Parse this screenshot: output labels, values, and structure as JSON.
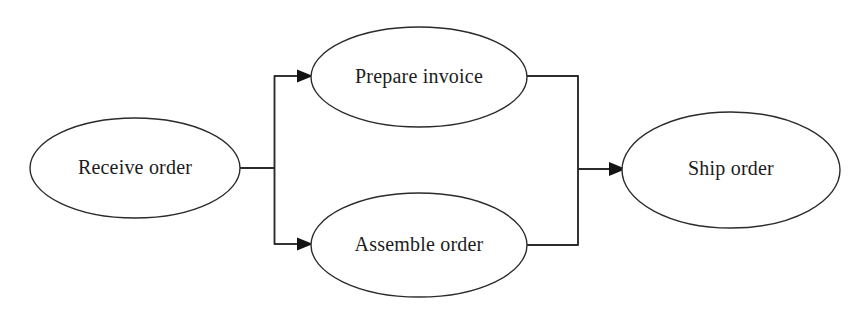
{
  "diagram": {
    "type": "flowchart",
    "background_color": "#ffffff",
    "line_color": "#2b2b2b",
    "text_color": "#1c1c1c",
    "nodes": [
      {
        "id": "receive-order",
        "label": "Receive order",
        "shape": "ellipse",
        "cx": 135,
        "cy": 168,
        "rx": 105,
        "ry": 50
      },
      {
        "id": "prepare-invoice",
        "label": "Prepare invoice",
        "shape": "ellipse",
        "cx": 419,
        "cy": 77,
        "rx": 108,
        "ry": 50
      },
      {
        "id": "assemble-order",
        "label": "Assemble order",
        "shape": "ellipse",
        "cx": 419,
        "cy": 245,
        "rx": 108,
        "ry": 52
      },
      {
        "id": "ship-order",
        "label": "Ship order",
        "shape": "ellipse",
        "cx": 731,
        "cy": 170,
        "rx": 109,
        "ry": 58
      }
    ],
    "edges": [
      {
        "id": "edge-receive-to-fork",
        "from": "receive-order",
        "to": "fork-bar",
        "arrow": false
      },
      {
        "id": "edge-fork-to-prepare",
        "from": "fork-bar",
        "to": "prepare-invoice",
        "arrow": true
      },
      {
        "id": "edge-fork-to-assemble",
        "from": "fork-bar",
        "to": "assemble-order",
        "arrow": true
      },
      {
        "id": "edge-prepare-to-join",
        "from": "prepare-invoice",
        "to": "join-bar",
        "arrow": false
      },
      {
        "id": "edge-assemble-to-join",
        "from": "assemble-order",
        "to": "join-bar",
        "arrow": false
      },
      {
        "id": "edge-join-to-ship",
        "from": "join-bar",
        "to": "ship-order",
        "arrow": true
      }
    ]
  }
}
